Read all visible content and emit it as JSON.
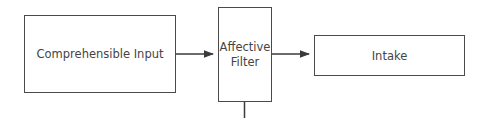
{
  "diagram": {
    "nodes": [
      {
        "id": "input",
        "label": "Comprehensible Input"
      },
      {
        "id": "filter",
        "label": "Affective\nFilter"
      },
      {
        "id": "intake",
        "label": "Intake"
      }
    ],
    "edges": [
      {
        "from": "input",
        "to": "filter"
      },
      {
        "from": "filter",
        "to": "intake"
      }
    ],
    "line_color": "#4a4a4a"
  }
}
